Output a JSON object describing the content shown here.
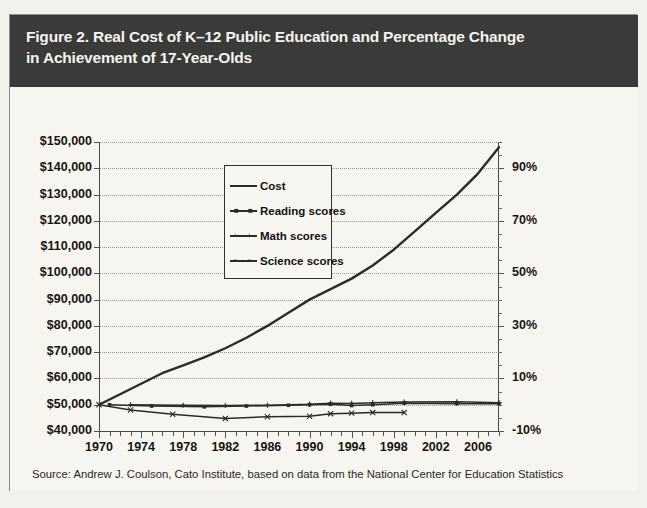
{
  "figure": {
    "title_line1": "Figure 2. Real Cost of K–12 Public Education and Percentage Change",
    "title_line2": "in Achievement of 17-Year-Olds",
    "source": "Source: Andrew J. Coulson, Cato Institute, based on data from the National Center for Education Statistics",
    "colors": {
      "banner_background": "#3a3a38",
      "banner_text": "#f4f3ef",
      "page_background": "#f3f1ec",
      "plot_background": "#f7f5f0",
      "series_line": "#2d2b27",
      "gridline": "#9a9790",
      "frame_border": "#8e8b84"
    }
  },
  "legend": {
    "position": "upper-left-inside-plot",
    "entries": [
      {
        "label": "Cost",
        "marker": "none"
      },
      {
        "label": "Reading scores",
        "marker": "square"
      },
      {
        "label": "Math scores",
        "marker": "cross"
      },
      {
        "label": "Science scores",
        "marker": "x"
      }
    ]
  },
  "chart_data": {
    "type": "line",
    "title": "Figure 2. Real Cost of K–12 Public Education and Percentage Change in Achievement of 17-Year-Olds",
    "xlabel": "",
    "ylabel": "",
    "grid": true,
    "legend_position": "upper left",
    "xlim": [
      1970,
      2008
    ],
    "x_tick_labels": [
      "1970",
      "1974",
      "1978",
      "1982",
      "1986",
      "1990",
      "1994",
      "1998",
      "2002",
      "2006"
    ],
    "x_ticks": [
      1970,
      1974,
      1978,
      1982,
      1986,
      1990,
      1994,
      1998,
      2002,
      2006
    ],
    "x_minor_tick_interval": 1,
    "left_axis": {
      "label": "",
      "ylim": [
        40000,
        150000
      ],
      "tick_values": [
        40000,
        50000,
        60000,
        70000,
        80000,
        90000,
        100000,
        110000,
        120000,
        130000,
        140000,
        150000
      ],
      "tick_labels": [
        "$40,000",
        "$50,000",
        "$60,000",
        "$70,000",
        "$80,000",
        "$90,000",
        "$100,000",
        "$110,000",
        "$120,000",
        "$130,000",
        "$140,000",
        "$150,000"
      ]
    },
    "right_axis": {
      "label": "",
      "ylim": [
        -10,
        100
      ],
      "tick_values": [
        -10,
        10,
        30,
        50,
        70,
        90
      ],
      "tick_labels": [
        "-10%",
        "10%",
        "30%",
        "50%",
        "70%",
        "90%"
      ]
    },
    "series": [
      {
        "name": "Cost",
        "axis": "left",
        "unit": "dollars",
        "x": [
          1970,
          1972,
          1974,
          1976,
          1978,
          1980,
          1982,
          1984,
          1986,
          1988,
          1990,
          1992,
          1994,
          1996,
          1998,
          2000,
          2002,
          2004,
          2006,
          2008
        ],
        "values": [
          50000,
          54000,
          58000,
          62000,
          65000,
          68000,
          71500,
          75500,
          80000,
          85000,
          90000,
          94000,
          98000,
          103000,
          109000,
          116000,
          123000,
          130000,
          138000,
          148000
        ]
      },
      {
        "name": "Reading scores",
        "axis": "right",
        "unit": "percent",
        "x": [
          1971,
          1975,
          1980,
          1984,
          1988,
          1990,
          1992,
          1994,
          1996,
          1999,
          2004,
          2008
        ],
        "values": [
          0,
          -0.5,
          -0.8,
          -0.5,
          -0.2,
          0.0,
          0.2,
          -0.3,
          0.0,
          0.6,
          0.4,
          0.4
        ]
      },
      {
        "name": "Math scores",
        "axis": "right",
        "unit": "percent",
        "x": [
          1973,
          1978,
          1982,
          1986,
          1990,
          1992,
          1994,
          1996,
          1999,
          2004,
          2008
        ],
        "values": [
          0,
          -0.2,
          -0.3,
          -0.2,
          0.2,
          0.6,
          0.5,
          0.8,
          1.0,
          1.1,
          0.8
        ]
      },
      {
        "name": "Science scores",
        "axis": "right",
        "unit": "percent",
        "x": [
          1970,
          1973,
          1977,
          1982,
          1986,
          1990,
          1992,
          1994,
          1996,
          1999
        ],
        "values": [
          0,
          -2.0,
          -3.6,
          -5.2,
          -4.6,
          -4.4,
          -3.4,
          -3.2,
          -3.0,
          -3.0
        ]
      }
    ]
  }
}
